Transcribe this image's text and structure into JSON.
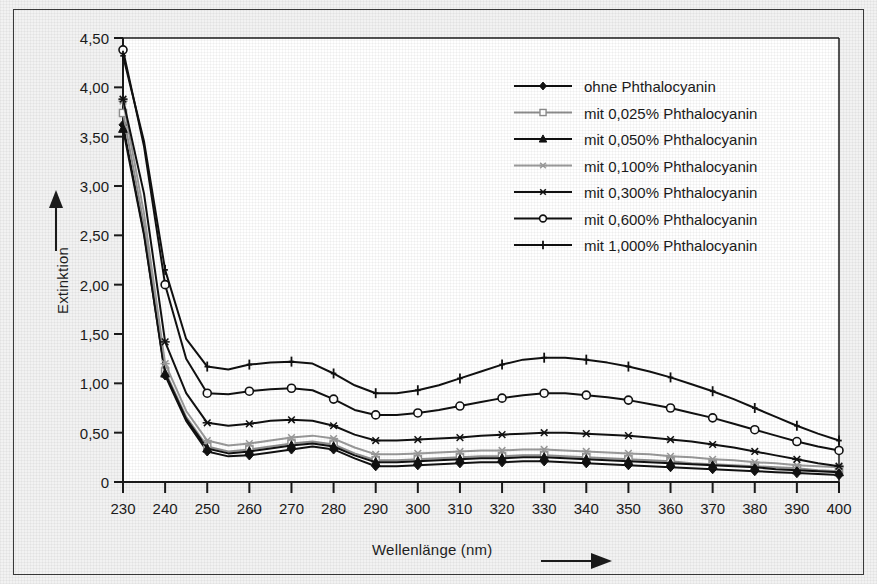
{
  "chart_data": {
    "type": "line",
    "title": "",
    "xlabel": "Wellenlänge (nm)",
    "ylabel": "Extinktion",
    "xlim": [
      230,
      400
    ],
    "ylim": [
      0,
      4.5
    ],
    "xticks": [
      230,
      240,
      250,
      260,
      270,
      280,
      290,
      300,
      310,
      320,
      330,
      340,
      350,
      360,
      370,
      380,
      390,
      400
    ],
    "xtick_labels": [
      "230",
      "240",
      "250",
      "260",
      "270",
      "280",
      "290",
      "300",
      "310",
      "320",
      "330",
      "340",
      "350",
      "360",
      "370",
      "380",
      "390",
      "400"
    ],
    "yticks": [
      0,
      0.5,
      1.0,
      1.5,
      2.0,
      2.5,
      3.0,
      3.5,
      4.0,
      4.5
    ],
    "ytick_labels": [
      "0",
      "0,50",
      "1,00",
      "1,50",
      "2,00",
      "2,50",
      "3,00",
      "3,50",
      "4,00",
      "4,50"
    ],
    "grid": false,
    "legend_position": "top-right",
    "x": [
      230,
      235,
      240,
      245,
      250,
      255,
      260,
      265,
      270,
      275,
      280,
      285,
      290,
      295,
      300,
      305,
      310,
      315,
      320,
      325,
      330,
      335,
      340,
      345,
      350,
      355,
      360,
      365,
      370,
      375,
      380,
      385,
      390,
      395,
      400
    ],
    "series": [
      {
        "name": "ohne Phthalocyanin",
        "marker": "filled-diamond",
        "color": "#111111",
        "values": [
          3.62,
          2.52,
          1.08,
          0.62,
          0.31,
          0.26,
          0.27,
          0.3,
          0.33,
          0.36,
          0.33,
          0.24,
          0.16,
          0.16,
          0.17,
          0.18,
          0.19,
          0.2,
          0.2,
          0.21,
          0.21,
          0.2,
          0.19,
          0.18,
          0.17,
          0.16,
          0.15,
          0.14,
          0.13,
          0.12,
          0.11,
          0.1,
          0.09,
          0.08,
          0.07
        ]
      },
      {
        "name": "mit 0,025% Phthalocyanin",
        "marker": "open-square",
        "color": "#8f8f8f",
        "values": [
          3.74,
          2.6,
          1.12,
          0.66,
          0.36,
          0.31,
          0.33,
          0.36,
          0.39,
          0.41,
          0.38,
          0.29,
          0.22,
          0.22,
          0.23,
          0.24,
          0.25,
          0.26,
          0.26,
          0.27,
          0.27,
          0.26,
          0.25,
          0.24,
          0.23,
          0.22,
          0.21,
          0.19,
          0.18,
          0.17,
          0.16,
          0.15,
          0.14,
          0.12,
          0.11
        ]
      },
      {
        "name": "mit 0,050% Phthalocyanin",
        "marker": "filled-triangle",
        "color": "#111111",
        "values": [
          3.58,
          2.5,
          1.1,
          0.64,
          0.34,
          0.29,
          0.31,
          0.34,
          0.37,
          0.39,
          0.36,
          0.27,
          0.2,
          0.2,
          0.21,
          0.22,
          0.23,
          0.24,
          0.24,
          0.25,
          0.25,
          0.24,
          0.23,
          0.22,
          0.21,
          0.2,
          0.19,
          0.18,
          0.17,
          0.16,
          0.15,
          0.13,
          0.12,
          0.11,
          0.1
        ]
      },
      {
        "name": "mit 0,100% Phthalocyanin",
        "marker": "star-x",
        "color": "#9a9a9a",
        "values": [
          3.86,
          2.72,
          1.2,
          0.72,
          0.42,
          0.37,
          0.39,
          0.42,
          0.45,
          0.47,
          0.44,
          0.35,
          0.28,
          0.28,
          0.29,
          0.3,
          0.31,
          0.32,
          0.32,
          0.33,
          0.33,
          0.32,
          0.31,
          0.3,
          0.29,
          0.28,
          0.26,
          0.25,
          0.23,
          0.22,
          0.2,
          0.19,
          0.17,
          0.16,
          0.15
        ]
      },
      {
        "name": "mit 0,300% Phthalocyanin",
        "marker": "star-x",
        "color": "#111111",
        "values": [
          3.88,
          2.92,
          1.42,
          0.9,
          0.6,
          0.57,
          0.59,
          0.62,
          0.63,
          0.62,
          0.57,
          0.48,
          0.42,
          0.42,
          0.43,
          0.44,
          0.45,
          0.47,
          0.48,
          0.49,
          0.5,
          0.5,
          0.49,
          0.48,
          0.47,
          0.45,
          0.43,
          0.41,
          0.38,
          0.35,
          0.31,
          0.27,
          0.23,
          0.19,
          0.16
        ]
      },
      {
        "name": "mit 0,600% Phthalocyanin",
        "marker": "open-circle",
        "color": "#111111",
        "values": [
          4.38,
          3.4,
          2.0,
          1.25,
          0.9,
          0.89,
          0.92,
          0.94,
          0.95,
          0.93,
          0.84,
          0.73,
          0.68,
          0.68,
          0.7,
          0.73,
          0.77,
          0.81,
          0.85,
          0.88,
          0.9,
          0.9,
          0.88,
          0.86,
          0.83,
          0.79,
          0.75,
          0.7,
          0.65,
          0.59,
          0.53,
          0.47,
          0.41,
          0.36,
          0.32
        ]
      },
      {
        "name": "mit 1,000% Phthalocyanin",
        "marker": "plus",
        "color": "#111111",
        "values": [
          4.32,
          3.45,
          2.15,
          1.45,
          1.17,
          1.14,
          1.19,
          1.21,
          1.22,
          1.2,
          1.1,
          0.98,
          0.9,
          0.9,
          0.93,
          0.98,
          1.05,
          1.12,
          1.19,
          1.24,
          1.26,
          1.26,
          1.24,
          1.21,
          1.17,
          1.12,
          1.06,
          0.99,
          0.92,
          0.84,
          0.75,
          0.66,
          0.57,
          0.49,
          0.42
        ]
      }
    ]
  },
  "legend": {
    "items": [
      {
        "label": "ohne Phthalocyanin"
      },
      {
        "label": "mit 0,025% Phthalocyanin"
      },
      {
        "label": "mit 0,050% Phthalocyanin"
      },
      {
        "label": "mit 0,100% Phthalocyanin"
      },
      {
        "label": "mit 0,300% Phthalocyanin"
      },
      {
        "label": "mit 0,600% Phthalocyanin"
      },
      {
        "label": "mit 1,000% Phthalocyanin"
      }
    ]
  },
  "axis": {
    "x_title": "Wellenlänge (nm)",
    "y_title": "Extinktion",
    "x_arrow_icon": "right-arrow-icon",
    "y_arrow_icon": "up-arrow-icon"
  }
}
